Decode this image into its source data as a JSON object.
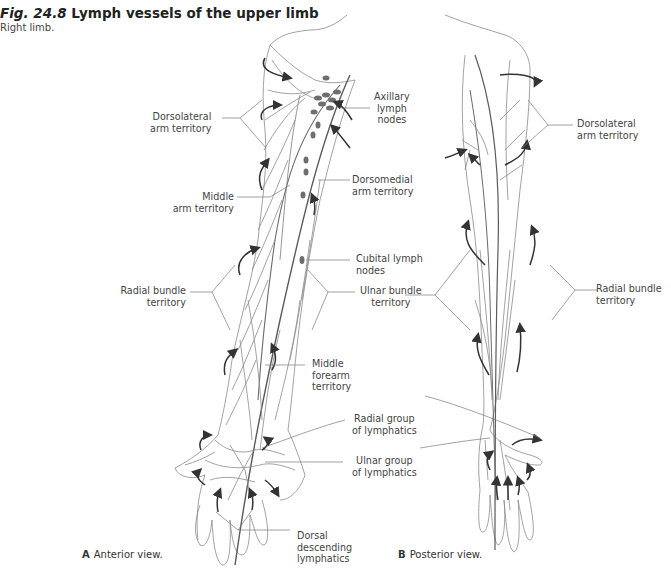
{
  "figure": {
    "number": "Fig. 24.8",
    "title": "Lymph vessels of the upper limb",
    "subtitle": "Right limb."
  },
  "panels": [
    {
      "letter": "A",
      "caption": "Anterior view.",
      "labels": [
        {
          "id": "dorsolateral",
          "text": [
            "Dorsolateral",
            "arm territory"
          ]
        },
        {
          "id": "axillary",
          "text": [
            "Axillary",
            "lymph",
            "nodes"
          ]
        },
        {
          "id": "dorsomedial",
          "text": [
            "Dorsomedial",
            "arm territory"
          ]
        },
        {
          "id": "middle-arm",
          "text": [
            "Middle",
            "arm territory"
          ]
        },
        {
          "id": "cubital",
          "text": [
            "Cubital lymph",
            "nodes"
          ]
        },
        {
          "id": "radial-bundle",
          "text": [
            "Radial bundle",
            "territory"
          ]
        },
        {
          "id": "ulnar-bundle",
          "text": [
            "Ulnar bundle",
            "territory"
          ]
        },
        {
          "id": "middle-forearm",
          "text": [
            "Middle",
            "forearm",
            "territory"
          ]
        },
        {
          "id": "radial-group",
          "text": [
            "Radial group",
            "of lymphatics"
          ]
        },
        {
          "id": "ulnar-group",
          "text": [
            "Ulnar group",
            "of lymphatics"
          ]
        },
        {
          "id": "dorsal-descending",
          "text": [
            "Dorsal",
            "descending",
            "lymphatics"
          ]
        }
      ]
    },
    {
      "letter": "B",
      "caption": "Posterior view.",
      "labels": [
        {
          "id": "dorsolateral-b",
          "text": [
            "Dorsolateral",
            "arm territory"
          ]
        },
        {
          "id": "radial-bundle-b",
          "text": [
            "Radial bundle",
            "territory"
          ]
        }
      ]
    }
  ],
  "colors": {
    "outline": "#8a8a8a",
    "vessel": "#9a9a9a",
    "main_vessel": "#5a5a5a",
    "node": "#6e6e6e",
    "arrow": "#333333",
    "leader": "#7a7a7a"
  }
}
